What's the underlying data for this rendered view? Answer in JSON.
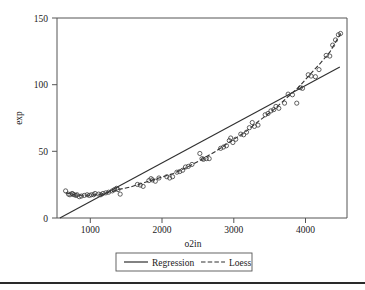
{
  "chart_data": {
    "type": "scatter",
    "title": "",
    "xlabel": "o2in",
    "ylabel": "exp",
    "xlim": [
      480,
      4520
    ],
    "ylim": [
      0,
      155
    ],
    "xticks": [
      1000,
      2000,
      3000,
      4000
    ],
    "yticks": [
      0,
      50,
      100,
      150
    ],
    "xtick_labels": [
      "1000",
      "2000",
      "3000",
      "4000"
    ],
    "ytick_labels": [
      "0",
      "50",
      "100",
      "150"
    ],
    "grid": false,
    "legend_position": "below-axis",
    "series": [
      {
        "name": "points",
        "label": "",
        "type": "scatter",
        "marker": "open-circle",
        "color": "#3a3a3a",
        "x": [
          600,
          640,
          660,
          690,
          700,
          720,
          745,
          760,
          790,
          820,
          860,
          900,
          930,
          960,
          990,
          1010,
          1060,
          1090,
          1120,
          1160,
          1200,
          1250,
          1280,
          1310,
          1330,
          1360,
          1600,
          1640,
          1680,
          1760,
          1790,
          1810,
          1850,
          1900,
          2010,
          2050,
          2090,
          2150,
          2190,
          2230,
          2270,
          2310,
          2360,
          2470,
          2500,
          2520,
          2560,
          2600,
          2760,
          2800,
          2840,
          2880,
          2900,
          2930,
          2970,
          3040,
          3080,
          3120,
          3160,
          3200,
          3230,
          3280,
          3380,
          3420,
          3460,
          3500,
          3530,
          3570,
          3650,
          3700,
          3760,
          3820,
          3870,
          3900,
          3980,
          4020,
          4080,
          4130,
          4230,
          4280,
          4320,
          4360,
          4400,
          4430
        ],
        "y": [
          21,
          18.5,
          18,
          19,
          18.5,
          18,
          17.5,
          18,
          16.5,
          17,
          17.5,
          18,
          17.5,
          18,
          18,
          19,
          18.5,
          18,
          19,
          19.5,
          20,
          21,
          22,
          23,
          22,
          18.5,
          26,
          25.5,
          24.5,
          29,
          30.5,
          29.5,
          28.5,
          31,
          32,
          31,
          32,
          35.5,
          36,
          37,
          39.5,
          40,
          41.5,
          50,
          46,
          45.5,
          46,
          46,
          54,
          55,
          56,
          60,
          62,
          58.5,
          61,
          65,
          64.5,
          66.5,
          70,
          74,
          71,
          72,
          80,
          81,
          83,
          84,
          86.5,
          85,
          89,
          96,
          95.5,
          89,
          101,
          100.5,
          111,
          110,
          109.5,
          115,
          126,
          125.5,
          134,
          138,
          142,
          143
        ]
      },
      {
        "name": "regression",
        "label": "Regression",
        "type": "line",
        "style": "solid",
        "color": "#303030",
        "x": [
          520,
          4420
        ],
        "y": [
          0,
          117
        ]
      },
      {
        "name": "loess",
        "label": "Loess",
        "type": "line",
        "style": "dashed",
        "color": "#303030",
        "x": [
          600,
          760,
          930,
          1090,
          1250,
          1330,
          1500,
          1700,
          1900,
          2100,
          2300,
          2500,
          2700,
          2900,
          3100,
          3300,
          3500,
          3700,
          3850,
          4000,
          4150,
          4280,
          4430
        ],
        "y": [
          19.5,
          17.6,
          17.6,
          18.4,
          20.6,
          22.0,
          24.0,
          27.5,
          31.0,
          34.5,
          39.5,
          45.5,
          52.0,
          59.5,
          66.5,
          75.5,
          84.0,
          94.0,
          101.5,
          111.0,
          120.0,
          128.5,
          143.0
        ]
      }
    ],
    "legend": [
      {
        "label": "Regression",
        "style": "solid"
      },
      {
        "label": "Loess",
        "style": "dashed"
      }
    ]
  },
  "figure": {
    "axis_x_label": "o2in",
    "axis_y_label": "exp"
  }
}
